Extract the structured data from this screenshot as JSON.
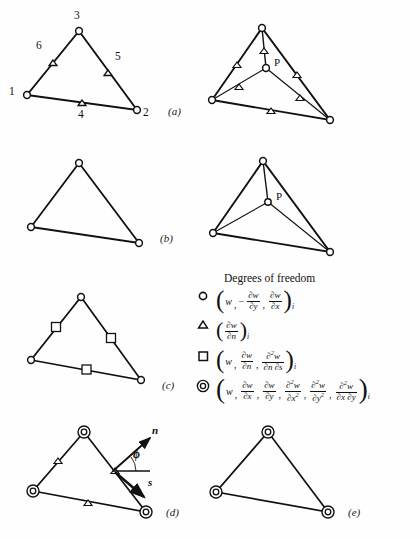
{
  "figure": {
    "panels": [
      {
        "id": "a",
        "label": "(a)",
        "x": 168,
        "y": 110
      },
      {
        "id": "b",
        "label": "(b)",
        "x": 160,
        "y": 236
      },
      {
        "id": "c",
        "label": "(c)",
        "x": 162,
        "y": 380
      },
      {
        "id": "d",
        "label": "(d)",
        "x": 166,
        "y": 510
      },
      {
        "id": "e",
        "label": "(e)",
        "x": 348,
        "y": 510
      }
    ],
    "node_numbers": [
      {
        "label": "1",
        "x": 9,
        "y": 89
      },
      {
        "label": "2",
        "x": 143,
        "y": 110
      },
      {
        "label": "3",
        "x": 74,
        "y": 10
      },
      {
        "label": "4",
        "x": 78,
        "y": 112
      },
      {
        "label": "5",
        "x": 115,
        "y": 54
      },
      {
        "label": "6",
        "x": 36,
        "y": 43
      }
    ],
    "point_labels": [
      {
        "label": "P",
        "x": 288,
        "y": 62
      },
      {
        "label": "P",
        "x": 290,
        "y": 195
      }
    ],
    "vectors": {
      "normal_label": "n",
      "normal_x": 152,
      "normal_y": 428,
      "tangent_label": "s",
      "tangent_x": 148,
      "tangent_y": 482,
      "angle_label": "ϕ",
      "angle_x": 133,
      "angle_y": 450
    }
  },
  "legend": {
    "title": "Degrees of freedom",
    "entries": [
      {
        "symbol": "circle",
        "symbol_name": "open-circle-dof-symbol",
        "terms": [
          "w",
          "-∂w/∂y",
          "∂w/∂x"
        ],
        "subscript": "i"
      },
      {
        "symbol": "triangle",
        "symbol_name": "triangle-dof-symbol",
        "terms": [
          "∂w/∂n"
        ],
        "subscript": "i"
      },
      {
        "symbol": "square",
        "symbol_name": "square-dof-symbol",
        "terms": [
          "w",
          "∂w/∂n",
          "∂²w/∂n∂s"
        ],
        "subscript": "i"
      },
      {
        "symbol": "double-circle",
        "symbol_name": "double-circle-dof-symbol",
        "terms": [
          "w",
          "∂w/∂x",
          "∂w/∂y",
          "∂²w/∂x²",
          "∂²w/∂y²",
          "∂²w/∂x∂y"
        ],
        "subscript": "i"
      }
    ],
    "parts": {
      "w": "w",
      "minus": "−",
      "comma": ",",
      "d": "∂",
      "dw": "∂w",
      "d2w": "∂",
      "dx": "∂x",
      "dy": "∂y",
      "dn": "∂n",
      "ds": "∂s",
      "dx2": "∂x",
      "dy2": "∂y",
      "dndx": "∂n ∂s",
      "dxdy": "∂x ∂y",
      "two": "2",
      "sub_i": "i",
      "lparen": "(",
      "rparen": ")"
    }
  },
  "colors": {
    "stroke": "#111111",
    "background": "#ffffff",
    "text": "#101010"
  }
}
